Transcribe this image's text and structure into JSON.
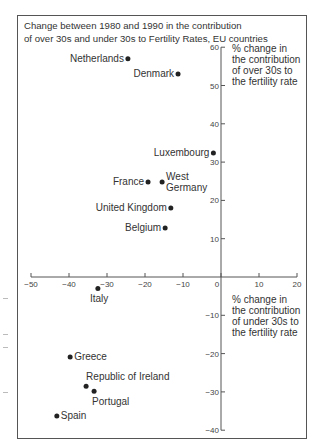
{
  "chart_data": {
    "type": "scatter",
    "title": "Change between 1980 and 1990 in the contribution of over 30s and under 30s to Fertility Rates, EU countries",
    "title_lines": [
      "Change between 1980 and 1990 in the contribution",
      "of over 30s and under 30s to Fertility Rates, EU countries"
    ],
    "xlabel": "% change in the contribution of under 30s to the fertility rate",
    "ylabel": "% change in the contribution of over 30s to the fertility rate",
    "xlabel_lines": [
      "% change in",
      "the contribution",
      "of under 30s to",
      "the fertility rate"
    ],
    "ylabel_lines": [
      "% change in",
      "the contribution",
      "of over 30s to",
      "the fertility rate"
    ],
    "xlim": [
      -50,
      20
    ],
    "ylim": [
      -40,
      60
    ],
    "x_ticks": [
      -50,
      -40,
      -30,
      -20,
      -10,
      0,
      10,
      20
    ],
    "y_ticks": [
      60,
      50,
      40,
      30,
      20,
      10,
      -10,
      -20,
      -30,
      -40
    ],
    "grid": false,
    "legend": null,
    "points": [
      {
        "label": "Netherlands",
        "x": -24.5,
        "y": 57
      },
      {
        "label": "Denmark",
        "x": -11.3,
        "y": 53
      },
      {
        "label": "Luxembourg",
        "x": -2,
        "y": 32.4
      },
      {
        "label": "France",
        "x": -19.2,
        "y": 24.8
      },
      {
        "label": "West Germany",
        "x": -15.5,
        "y": 24.8
      },
      {
        "label": "United Kingdom",
        "x": -13.2,
        "y": 18
      },
      {
        "label": "Belgium",
        "x": -14.7,
        "y": 12.8
      },
      {
        "label": "Italy",
        "x": -32.4,
        "y": -3
      },
      {
        "label": "Greece",
        "x": -39.7,
        "y": -20.9
      },
      {
        "label": "Republic of Ireland",
        "x": -35.5,
        "y": -28.5
      },
      {
        "label": "Portugal",
        "x": -33.4,
        "y": -29.8
      },
      {
        "label": "Spain",
        "x": -43.2,
        "y": -36.3
      }
    ]
  }
}
